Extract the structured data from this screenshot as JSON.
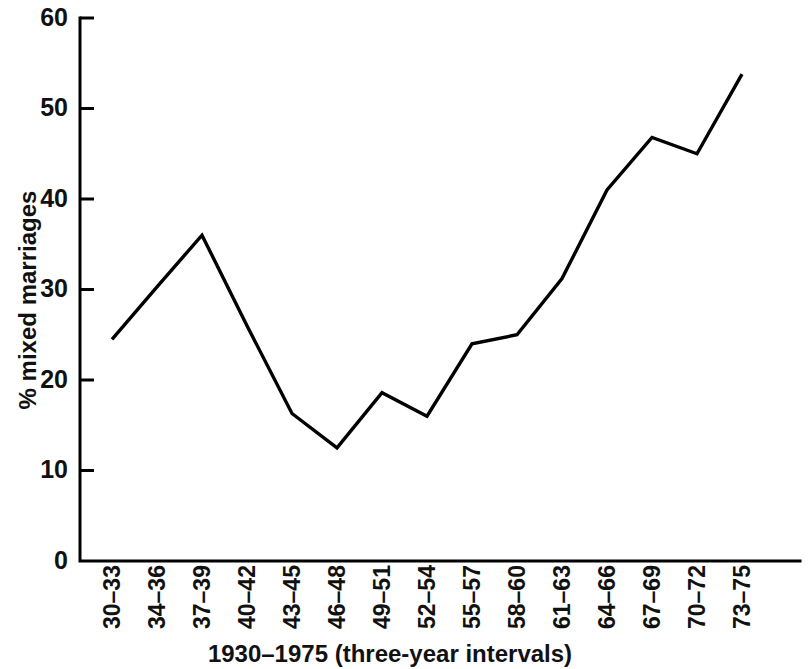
{
  "chart_data": {
    "type": "line",
    "title": "",
    "xlabel": "1930–1975 (three-year intervals)",
    "ylabel": "% mixed marriages",
    "categories": [
      "30–33",
      "34–36",
      "37–39",
      "40–42",
      "43–45",
      "46–48",
      "49–51",
      "52–54",
      "55–57",
      "58–60",
      "61–63",
      "64–66",
      "67–69",
      "70–72",
      "73–75"
    ],
    "values": [
      24.5,
      30.3,
      36.0,
      26.0,
      16.3,
      12.5,
      18.6,
      16.0,
      24.0,
      25.0,
      31.2,
      41.0,
      46.8,
      45.0,
      53.8
    ],
    "ylim": [
      0,
      60
    ],
    "yticks": [
      0,
      10,
      20,
      30,
      40,
      50,
      60
    ],
    "ytick_labels": [
      "0",
      "10",
      "20",
      "30",
      "40",
      "50",
      "60"
    ],
    "grid": false,
    "legend": false,
    "line_color": "#000000",
    "axis_color": "#000000",
    "background_color": "#ffffff"
  },
  "axis_labels": {
    "x_title": "1930–1975 (three-year intervals)",
    "y_title": "% mixed marriages"
  }
}
